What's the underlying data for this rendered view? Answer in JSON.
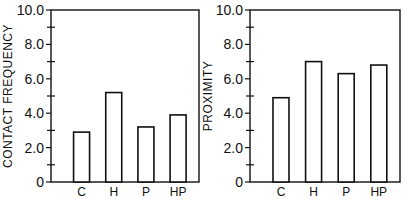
{
  "chart_data": [
    {
      "type": "bar",
      "title": "",
      "xlabel": "",
      "ylabel": "CONTACT FREQUENCY",
      "categories": [
        "C",
        "H",
        "P",
        "HP"
      ],
      "values": [
        2.9,
        5.2,
        3.2,
        3.9
      ],
      "ylim": [
        0,
        10.0
      ],
      "yticks": [
        "0",
        "2.0",
        "4.0",
        "6.0",
        "8.0",
        "10.0"
      ],
      "grid": false,
      "legend": null
    },
    {
      "type": "bar",
      "title": "",
      "xlabel": "",
      "ylabel": "PROXIMITY",
      "categories": [
        "C",
        "H",
        "P",
        "HP"
      ],
      "values": [
        4.9,
        7.0,
        6.3,
        6.8
      ],
      "ylim": [
        0,
        10.0
      ],
      "yticks": [
        "0",
        "2.0",
        "4.0",
        "6.0",
        "8.0",
        "10.0"
      ],
      "grid": false,
      "legend": null
    }
  ]
}
